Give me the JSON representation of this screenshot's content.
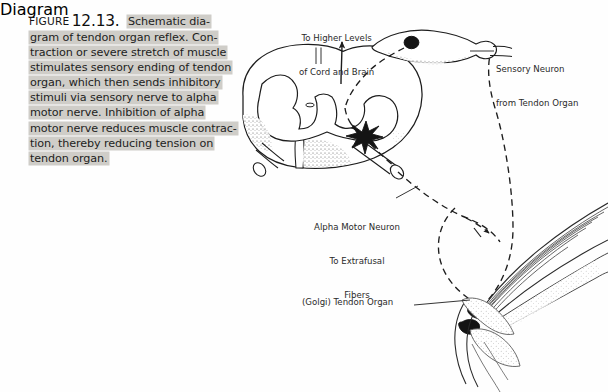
{
  "figure": {
    "label_prefix": "FIGURE",
    "number": "12.13.",
    "caption_lines": [
      "Schematic dia-",
      "gram of tendon organ reflex. Con-",
      "traction or severe stretch of muscle",
      "stimulates sensory ending of tendon",
      "organ, which then sends inhibitory",
      "stimuli via sensory nerve to alpha",
      "motor nerve. Inhibition of alpha",
      "motor nerve reduces muscle contrac-",
      "tion, thereby reducing tension on",
      "tendon organ."
    ],
    "caption_full": "FIGURE 12.13. Schematic diagram of tendon organ reflex. Contraction or severe stretch of muscle stimulates sensory ending of tendon organ, which then sends inhibitory stimuli via sensory nerve to alpha motor nerve. Inhibition of alpha motor nerve reduces muscle contraction, thereby reducing tension on tendon organ."
  },
  "diagram": {
    "labels": {
      "higher_levels_line1": "To Higher Levels",
      "higher_levels_line2": "of Cord and Brain",
      "sensory_neuron_line1": "Sensory Neuron",
      "sensory_neuron_line2": "from Tendon Organ",
      "alpha_motor_line1": "Alpha Motor Neuron",
      "alpha_motor_line2": "To Extrafusal",
      "alpha_motor_line3": "Fibers",
      "golgi_tendon_organ": "(Golgi) Tendon Organ"
    },
    "parts": {
      "spinal_cord": "spinal-cord-cross-section",
      "gray_matter": "butterfly-gray-matter",
      "dorsal_root_ganglion": "dorsal-root-ganglion",
      "ganglion_cell_body": "sensory-cell-body",
      "synapse": "interneuron-synapse-star",
      "ascending_arrow": "ascending-tract-arrow",
      "muscle": "skeletal-muscle-fibers",
      "tendon": "tendon",
      "bone": "bone",
      "golgi_organ": "golgi-tendon-organ"
    }
  },
  "colors": {
    "ink": "#1d1d1d",
    "highlight": "#cfcdc8",
    "paper": "#fefefe",
    "label_text": "#2a2a2a",
    "shading": "#6b6b6b"
  }
}
